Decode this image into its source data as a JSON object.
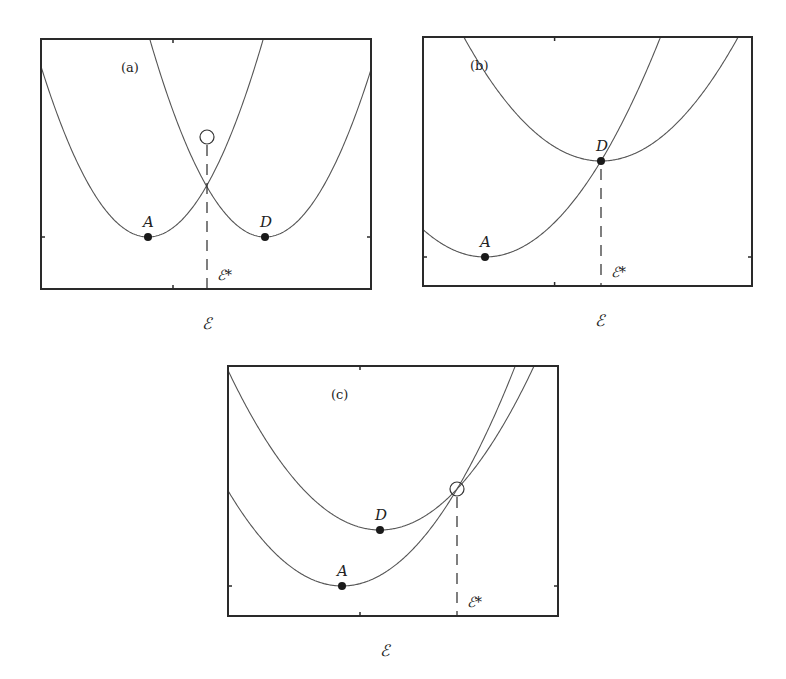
{
  "figure": {
    "panels": [
      {
        "id": "a",
        "panel_label": "(a)",
        "frame": {
          "x": 41,
          "y": 39,
          "w": 330,
          "h": 250
        },
        "xlabel": "ℰ",
        "threshold_label": "ℰ*",
        "threshold_x": 207,
        "crossing_marker": "circle",
        "crossing": {
          "x": 207,
          "y": 137
        },
        "curves": [
          {
            "name": "A",
            "min": {
              "x": 148,
              "y": 237
            },
            "k": 0.0149
          },
          {
            "name": "D",
            "min": {
              "x": 265,
              "y": 237
            },
            "k": 0.0149
          }
        ],
        "points": [
          {
            "label": "A",
            "x": 148,
            "y": 237
          },
          {
            "label": "D",
            "x": 265,
            "y": 237
          }
        ]
      },
      {
        "id": "b",
        "panel_label": "(b)",
        "frame": {
          "x": 423,
          "y": 37,
          "w": 329,
          "h": 249
        },
        "xlabel": "ℰ",
        "threshold_label": "ℰ*",
        "threshold_x": 601,
        "crossing_marker": "none",
        "crossing": {
          "x": 601,
          "y": 161
        },
        "curves": [
          {
            "name": "A",
            "min": {
              "x": 485,
              "y": 257
            },
            "k": 0.00714
          },
          {
            "name": "D",
            "min": {
              "x": 601,
              "y": 161
            },
            "k": 0.00659
          }
        ],
        "points": [
          {
            "label": "A",
            "x": 485,
            "y": 257
          },
          {
            "label": "D",
            "x": 601,
            "y": 161
          }
        ]
      },
      {
        "id": "c",
        "panel_label": "(c)",
        "frame": {
          "x": 228,
          "y": 366,
          "w": 330,
          "h": 250
        },
        "xlabel": "ℰ",
        "threshold_label": "ℰ*",
        "threshold_x": 457,
        "crossing_marker": "circle",
        "crossing": {
          "x": 457,
          "y": 489
        },
        "curves": [
          {
            "name": "A",
            "min": {
              "x": 342,
              "y": 586
            },
            "k": 0.00733
          },
          {
            "name": "D",
            "min": {
              "x": 380,
              "y": 530
            },
            "k": 0.00691
          }
        ],
        "points": [
          {
            "label": "A",
            "x": 342,
            "y": 586
          },
          {
            "label": "D",
            "x": 380,
            "y": 530
          }
        ]
      }
    ]
  }
}
